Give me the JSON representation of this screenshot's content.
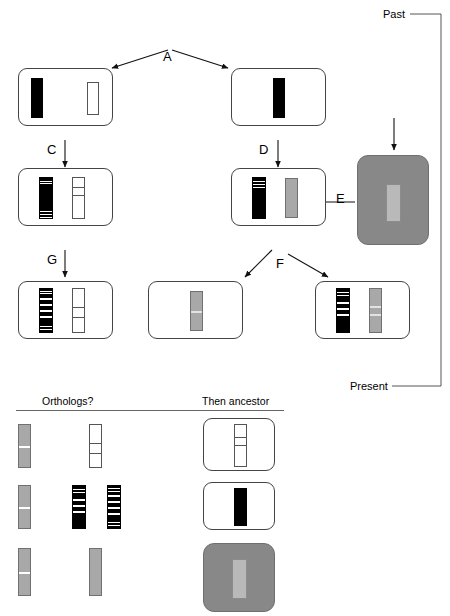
{
  "diagram": {
    "timeline": {
      "past_label": "Past",
      "present_label": "Present"
    },
    "process_labels": {
      "A": "A",
      "B": "B",
      "C": "C",
      "D": "D",
      "E": "E",
      "F": "F",
      "G": "G"
    },
    "bottom_panel": {
      "orthologs_header": "Orthologs?",
      "ancestor_header": "Then ancestor"
    },
    "colors": {
      "black": "#000000",
      "shaded_box": "#888888",
      "gray_chromosome": "#a8a8a8",
      "light_gray_chromosome": "#b9b9b9",
      "box_border": "#444444",
      "white": "#ffffff"
    },
    "boxes": [
      {
        "id": "box-top-left",
        "label": "ancestral genome with duplicated gene"
      },
      {
        "id": "box-top-right",
        "label": "ancestral genome single gene"
      },
      {
        "id": "box-mid-left",
        "label": "diverged left lineage"
      },
      {
        "id": "box-mid-right",
        "label": "diverged right lineage"
      },
      {
        "id": "box-shaded-right",
        "label": "outgroup shaded genome"
      },
      {
        "id": "box-bottom-left",
        "label": "present left lineage"
      },
      {
        "id": "box-bottom-middle",
        "label": "present middle lineage"
      },
      {
        "id": "box-bottom-right",
        "label": "present right lineage"
      }
    ],
    "ortholog_rows": [
      {
        "id": "row-1",
        "ancestor": "hollow-chromosome-box"
      },
      {
        "id": "row-2",
        "ancestor": "black-chromosome-box"
      },
      {
        "id": "row-3",
        "ancestor": "shaded-gray-chromosome-box"
      }
    ]
  }
}
